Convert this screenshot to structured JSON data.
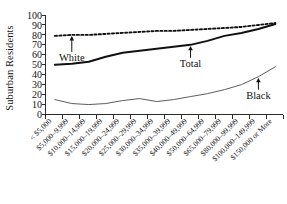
{
  "chart_data": {
    "type": "line",
    "title": "",
    "xlabel": "",
    "ylabel": "Suburban Residents",
    "ylim": [
      0,
      100
    ],
    "ytick_values": [
      0,
      10,
      20,
      30,
      40,
      50,
      60,
      70,
      80,
      90,
      100
    ],
    "grid": false,
    "legend_position": "inline-annotations",
    "categories": [
      "< $5,000",
      "$5,000–9,999",
      "$10,000–14,999",
      "$15,000–19,999",
      "$20,000–24,999",
      "$25,000–29,999",
      "$30,000–34,999",
      "$35,000–39,999",
      "$40,000–49,999",
      "$50,000–64,999",
      "$65,000–79,999",
      "$80,000–99,999",
      "$100,000–149,999",
      "$150,000 or More"
    ],
    "series": [
      {
        "name": "White",
        "style": "dotted",
        "color": "#111111",
        "values": [
          79,
          80,
          80,
          81,
          82,
          83,
          84,
          84,
          85,
          86,
          87,
          88,
          90,
          92
        ]
      },
      {
        "name": "Total",
        "style": "solid-thick",
        "color": "#111111",
        "values": [
          50,
          51,
          53,
          58,
          62,
          64,
          66,
          68,
          70,
          74,
          79,
          82,
          86,
          91
        ]
      },
      {
        "name": "Black",
        "style": "solid-thin",
        "color": "#4a4a4a",
        "values": [
          15,
          11,
          10,
          11,
          14,
          16,
          13,
          15,
          18,
          21,
          25,
          30,
          38,
          48
        ]
      }
    ],
    "annotations": [
      {
        "label": "White",
        "series": "White",
        "category_index": 1
      },
      {
        "label": "Total",
        "series": "Total",
        "category_index": 8
      },
      {
        "label": "Black",
        "series": "Black",
        "category_index": 12
      }
    ]
  },
  "caption": ""
}
